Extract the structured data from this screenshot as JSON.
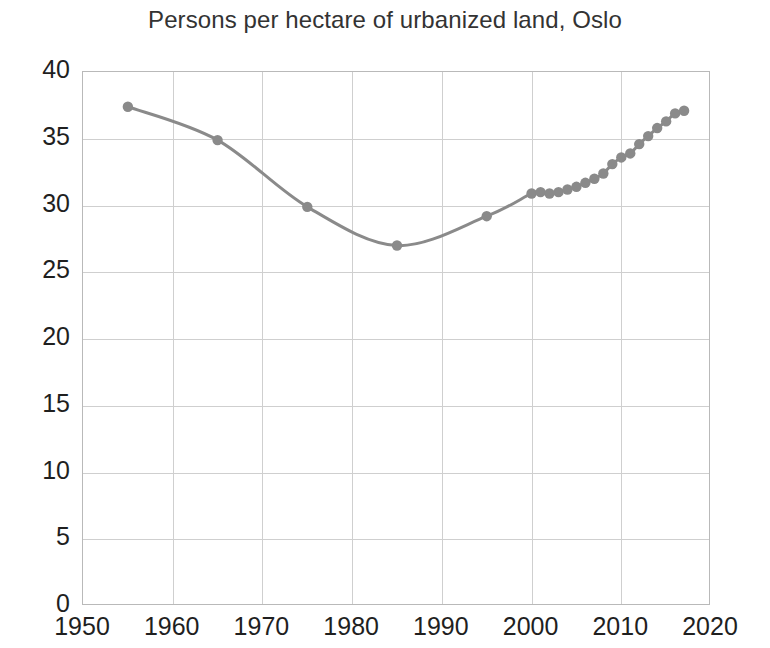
{
  "chart_data": {
    "type": "line",
    "title": "Persons per hectare of urbanized land, Oslo",
    "xlabel": "",
    "ylabel": "",
    "xlim": [
      1950,
      2020
    ],
    "ylim": [
      0,
      40
    ],
    "xticks": [
      1950,
      1960,
      1970,
      1980,
      1990,
      2000,
      2010,
      2020
    ],
    "yticks": [
      0,
      5,
      10,
      15,
      20,
      25,
      30,
      35,
      40
    ],
    "grid": true,
    "legend": false,
    "series_color": "#8a8a8a",
    "marker": "circle",
    "series": [
      {
        "name": "Persons per hectare",
        "x": [
          1955,
          1965,
          1975,
          1985,
          1995,
          2000,
          2001,
          2002,
          2003,
          2004,
          2005,
          2006,
          2007,
          2008,
          2009,
          2010,
          2011,
          2012,
          2013,
          2014,
          2015,
          2016,
          2017
        ],
        "values": [
          37.4,
          34.9,
          29.9,
          27.0,
          29.2,
          30.9,
          31.0,
          30.9,
          31.0,
          31.2,
          31.4,
          31.7,
          32.0,
          32.4,
          33.1,
          33.6,
          33.9,
          34.6,
          35.2,
          35.8,
          36.3,
          36.9,
          37.1
        ]
      }
    ]
  },
  "ghost_text": {
    "line1": "",
    "line2": ""
  }
}
